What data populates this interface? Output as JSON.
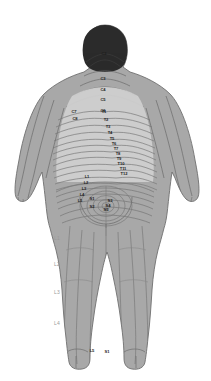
{
  "figure": {
    "view": "posterior",
    "colors": {
      "background": "#ffffff",
      "hair": "#2b2b2b",
      "skin_mid": "#a8a8a8",
      "skin_light": "#c2c2c2",
      "skin_dark": "#9a9a9a",
      "back_field": "#cfcfcf",
      "outline": "#6f6f6f",
      "dermatome_line": "#7a7a7a",
      "label_text": "#1d1d1d",
      "margin_label_text": "#9a9a9a"
    }
  },
  "margin_legend": {
    "items": [
      {
        "label": "L1",
        "x": 54,
        "y": 240
      },
      {
        "label": "L2",
        "x": 54,
        "y": 266
      },
      {
        "label": "L3",
        "x": 54,
        "y": 294
      },
      {
        "label": "L4",
        "x": 54,
        "y": 325
      }
    ]
  },
  "segment_labels": {
    "cervical": [
      {
        "label": "C2",
        "x": 104,
        "y": 55,
        "fill": "#d8d8d8"
      },
      {
        "label": "C3",
        "x": 103,
        "y": 80,
        "fill": "#1d1d1d"
      },
      {
        "label": "C4",
        "x": 103,
        "y": 91,
        "fill": "#1d1d1d"
      },
      {
        "label": "C5",
        "x": 103,
        "y": 101,
        "fill": "#1d1d1d"
      },
      {
        "label": "C6",
        "x": 103,
        "y": 112,
        "fill": "#1d1d1d"
      },
      {
        "label": "C7",
        "x": 74,
        "y": 113,
        "fill": "#1d1d1d"
      },
      {
        "label": "C8",
        "x": 75,
        "y": 120,
        "fill": "#1d1d1d"
      }
    ],
    "thoracic": [
      {
        "label": "T1",
        "x": 104,
        "y": 113
      },
      {
        "label": "T2",
        "x": 106,
        "y": 121
      },
      {
        "label": "T3",
        "x": 108,
        "y": 128
      },
      {
        "label": "T4",
        "x": 110,
        "y": 134
      },
      {
        "label": "T5",
        "x": 112,
        "y": 140
      },
      {
        "label": "T6",
        "x": 114,
        "y": 145
      },
      {
        "label": "T7",
        "x": 116,
        "y": 150
      },
      {
        "label": "T8",
        "x": 118,
        "y": 155
      },
      {
        "label": "T9",
        "x": 119,
        "y": 160
      },
      {
        "label": "T10",
        "x": 121,
        "y": 165
      },
      {
        "label": "T11",
        "x": 123,
        "y": 170
      },
      {
        "label": "T12",
        "x": 124,
        "y": 175
      }
    ],
    "lumbar": [
      {
        "label": "L1",
        "x": 87,
        "y": 178
      },
      {
        "label": "L2",
        "x": 86,
        "y": 184
      },
      {
        "label": "L3",
        "x": 84,
        "y": 190
      },
      {
        "label": "L4",
        "x": 82,
        "y": 196
      },
      {
        "label": "L5",
        "x": 80,
        "y": 202
      }
    ],
    "sacral": [
      {
        "label": "S1",
        "x": 92,
        "y": 200
      },
      {
        "label": "S2",
        "x": 92,
        "y": 208
      },
      {
        "label": "S3",
        "x": 110,
        "y": 202
      },
      {
        "label": "S4",
        "x": 108,
        "y": 207
      },
      {
        "label": "S5",
        "x": 106,
        "y": 211
      }
    ],
    "lower_limb": [
      {
        "label": "L5",
        "x": 92,
        "y": 352
      },
      {
        "label": "S1",
        "x": 107,
        "y": 353
      }
    ]
  }
}
